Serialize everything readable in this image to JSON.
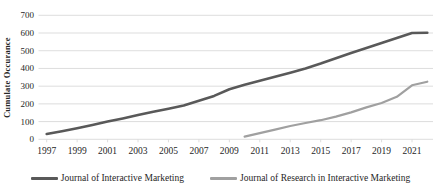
{
  "y_axis": {
    "title": "Cumulate Occurance",
    "ticks": [
      0,
      100,
      200,
      300,
      400,
      500,
      600,
      700
    ],
    "min": 0,
    "max": 700
  },
  "x_axis": {
    "tick_years": [
      1997,
      1999,
      2001,
      2003,
      2005,
      2007,
      2009,
      2011,
      2013,
      2015,
      2017,
      2019,
      2021
    ]
  },
  "legend": [
    {
      "label": "Journal of Interactive Marketing",
      "color": "#595959"
    },
    {
      "label": "Journal of Research in Interactive Marketing",
      "color": "#a0a0a0"
    }
  ],
  "colors": {
    "gridline": "#d9d9d9",
    "tick_mark": "#d9d9d9",
    "text": "#262626",
    "background": "#ffffff"
  },
  "chart_data": {
    "type": "line",
    "title": "",
    "xlabel": "",
    "ylabel": "Cumulate Occurance",
    "xlim": [
      1996.5,
      2022.6
    ],
    "ylim": [
      0,
      700
    ],
    "grid": "horizontal",
    "legend_position": "bottom",
    "series": [
      {
        "name": "Journal of Interactive Marketing",
        "color": "#595959",
        "stroke_width": 2.6,
        "x": [
          1997,
          1998,
          1999,
          2000,
          2001,
          2002,
          2003,
          2004,
          2005,
          2006,
          2007,
          2008,
          2009,
          2010,
          2011,
          2012,
          2013,
          2014,
          2015,
          2016,
          2017,
          2018,
          2019,
          2020,
          2021,
          2022
        ],
        "values": [
          30,
          46,
          62,
          80,
          100,
          118,
          137,
          155,
          173,
          191,
          218,
          245,
          283,
          308,
          330,
          353,
          376,
          400,
          428,
          458,
          487,
          515,
          543,
          572,
          600,
          602
        ]
      },
      {
        "name": "Journal of Research in Interactive Marketing",
        "color": "#a0a0a0",
        "stroke_width": 2.2,
        "x": [
          2010,
          2011,
          2012,
          2013,
          2014,
          2015,
          2016,
          2017,
          2018,
          2019,
          2020,
          2021,
          2022
        ],
        "values": [
          15,
          35,
          55,
          75,
          92,
          108,
          128,
          152,
          180,
          205,
          240,
          305,
          325
        ]
      }
    ]
  }
}
